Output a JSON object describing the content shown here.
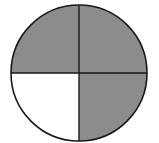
{
  "diagram": {
    "type": "fraction-circle",
    "total_parts": 4,
    "shaded_parts": 3,
    "fraction": "3/4",
    "parts": [
      {
        "position": "top-left",
        "shaded": true
      },
      {
        "position": "top-right",
        "shaded": true
      },
      {
        "position": "bottom-right",
        "shaded": true
      },
      {
        "position": "bottom-left",
        "shaded": false
      }
    ],
    "colors": {
      "shaded": "#8c8c8c",
      "unshaded": "#ffffff",
      "stroke": "#1a1a1a"
    }
  }
}
